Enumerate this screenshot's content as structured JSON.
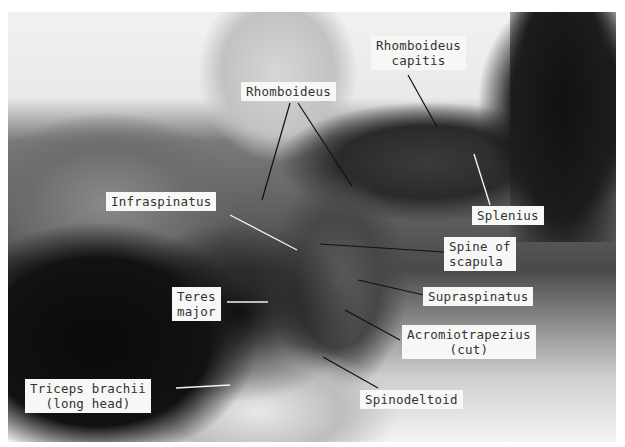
{
  "image": {
    "description": "Dissection photograph, lateral view of cat shoulder and neck musculature, black and white",
    "labels": [
      {
        "id": "rhomboideus-capitis",
        "text": "Rhomboideus\ncapitis"
      },
      {
        "id": "rhomboideus",
        "text": "Rhomboideus"
      },
      {
        "id": "infraspinatus",
        "text": "Infraspinatus"
      },
      {
        "id": "splenius",
        "text": "Splenius"
      },
      {
        "id": "spine-of-scapula",
        "text": "Spine of\nscapula"
      },
      {
        "id": "teres-major",
        "text": "Teres\nmajor"
      },
      {
        "id": "supraspinatus",
        "text": "Supraspinatus"
      },
      {
        "id": "acromiotrapezius",
        "text": "Acromiotrapezius\n(cut)"
      },
      {
        "id": "triceps-brachii",
        "text": "Triceps brachii\n(long head)"
      },
      {
        "id": "spinodeltoid",
        "text": "Spinodeltoid"
      }
    ]
  }
}
